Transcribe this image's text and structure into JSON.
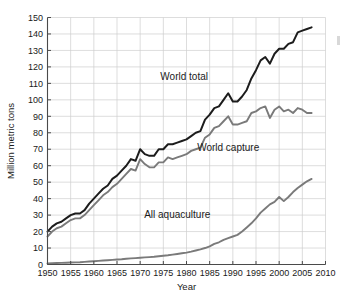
{
  "chart_data": {
    "type": "line",
    "title": "",
    "xlabel": "Year",
    "ylabel": "Million metric tons",
    "xlim": [
      1950,
      2010
    ],
    "ylim": [
      0,
      150
    ],
    "grid": true,
    "legend_position": "inline-annotations",
    "xticks": [
      1950,
      1955,
      1960,
      1965,
      1970,
      1975,
      1980,
      1985,
      1990,
      1995,
      2000,
      2005,
      2010
    ],
    "xtick_labels": [
      "1950",
      "1955",
      "1960",
      "1965",
      "1970",
      "1975",
      "1980",
      "1985",
      "1990",
      "1995",
      "2000",
      "2005",
      "2010"
    ],
    "yticks": [
      0,
      10,
      20,
      30,
      40,
      50,
      60,
      70,
      80,
      90,
      100,
      110,
      120,
      130,
      140,
      150
    ],
    "ytick_labels": [
      "0",
      "10",
      "20",
      "30",
      "40",
      "50",
      "60",
      "70",
      "80",
      "90",
      "100",
      "110",
      "120",
      "130",
      "140",
      "150"
    ],
    "x": [
      1950,
      1951,
      1952,
      1953,
      1954,
      1955,
      1956,
      1957,
      1958,
      1959,
      1960,
      1961,
      1962,
      1963,
      1964,
      1965,
      1966,
      1967,
      1968,
      1969,
      1970,
      1971,
      1972,
      1973,
      1974,
      1975,
      1976,
      1977,
      1978,
      1979,
      1980,
      1981,
      1982,
      1983,
      1984,
      1985,
      1986,
      1987,
      1988,
      1989,
      1990,
      1991,
      1992,
      1993,
      1994,
      1995,
      1996,
      1997,
      1998,
      1999,
      2000,
      2001,
      2002,
      2003,
      2004,
      2005,
      2006,
      2007
    ],
    "series": [
      {
        "name": "World total",
        "color": "#1c1c1c",
        "label_text": "World total",
        "values": [
          20,
          23,
          25,
          26,
          28,
          30,
          31,
          31,
          33,
          37,
          40,
          43,
          46,
          48,
          52,
          54,
          57,
          60,
          64,
          63,
          70,
          67,
          66,
          66,
          70,
          70,
          73,
          73,
          74,
          75,
          76,
          78,
          80,
          81,
          88,
          91,
          95,
          96,
          100,
          104,
          99,
          99,
          102,
          106,
          113,
          118,
          124,
          126,
          122,
          128,
          131,
          131,
          134,
          135,
          141,
          142,
          143,
          144
        ]
      },
      {
        "name": "World capture",
        "color": "#7a7a7a",
        "label_text": "World capture",
        "values": [
          17,
          20,
          22,
          23,
          25,
          27,
          28,
          28,
          30,
          33,
          36,
          39,
          42,
          44,
          47,
          49,
          52,
          55,
          58,
          57,
          64,
          61,
          59,
          59,
          62,
          62,
          65,
          64,
          65,
          66,
          67,
          69,
          70,
          71,
          77,
          79,
          83,
          84,
          87,
          90,
          85,
          85,
          86,
          87,
          92,
          93,
          95,
          96,
          89,
          94,
          96,
          93,
          94,
          92,
          95,
          94,
          92,
          92
        ]
      },
      {
        "name": "All aquaculture",
        "color": "#7a7a7a",
        "label_text": "All aquaculture",
        "values": [
          0.6,
          0.8,
          0.9,
          1.0,
          1.1,
          1.2,
          1.3,
          1.4,
          1.6,
          1.8,
          2.0,
          2.2,
          2.4,
          2.6,
          2.8,
          3.0,
          3.2,
          3.5,
          3.7,
          3.9,
          4.1,
          4.3,
          4.5,
          4.7,
          5.0,
          5.3,
          5.6,
          6.0,
          6.4,
          6.8,
          7.2,
          7.8,
          8.5,
          9.2,
          10.0,
          11.0,
          12.5,
          13.5,
          15.0,
          16.0,
          17.0,
          18.0,
          20.0,
          22.5,
          25.0,
          28.0,
          31.5,
          34.0,
          36.5,
          38.0,
          41.0,
          38.5,
          41.0,
          44.0,
          46.5,
          48.5,
          50.5,
          52.0
        ]
      }
    ],
    "annotations": [
      {
        "text": "World total",
        "x_year": 1979.5,
        "y_value": 112
      },
      {
        "text": "World capture",
        "x_year": 1989.0,
        "y_value": 69
      },
      {
        "text": "All aquaculture",
        "x_year": 1978.0,
        "y_value": 28
      }
    ]
  }
}
